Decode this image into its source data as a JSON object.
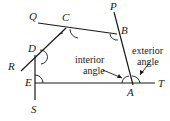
{
  "diagram": {
    "type": "polygon-angles",
    "vertices": [
      "A",
      "B",
      "C",
      "D",
      "E"
    ],
    "extension_points": [
      "P",
      "Q",
      "R",
      "S",
      "T"
    ],
    "annotations": {
      "interior_line1": "interior",
      "interior_line2": "angle",
      "exterior_line1": "exterior",
      "exterior_line2": "angle"
    },
    "colors": {
      "stroke": "#1a1a1a",
      "background": "#ffffff"
    }
  }
}
